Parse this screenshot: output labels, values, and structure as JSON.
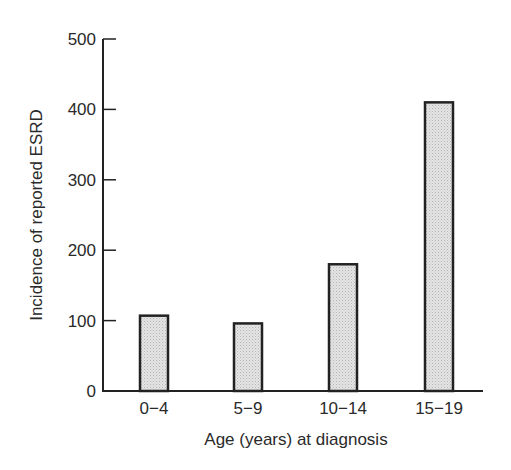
{
  "chart_data": {
    "type": "bar",
    "title": "",
    "xlabel": "Age (years) at diagnosis",
    "ylabel": "Incidence of reported ESRD",
    "categories": [
      "0−4",
      "5−9",
      "10−14",
      "15−19"
    ],
    "values": [
      107,
      96,
      180,
      410
    ],
    "ylim": [
      0,
      500
    ],
    "yticks": [
      0,
      100,
      200,
      300,
      400,
      500
    ],
    "grid": false,
    "legend": null,
    "colors": {
      "bar_fill": "#d9d9d9",
      "bar_stroke": "#222222",
      "axis": "#222222"
    }
  }
}
